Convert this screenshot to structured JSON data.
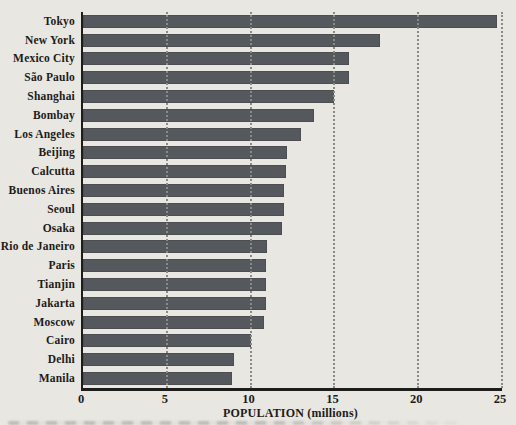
{
  "chart_data": {
    "type": "bar",
    "orientation": "horizontal",
    "title": "",
    "xlabel": "POPULATION (millions)",
    "ylabel": "",
    "categories": [
      "Tokyo",
      "New York",
      "Mexico City",
      "São Paulo",
      "Shanghai",
      "Bombay",
      "Los Angeles",
      "Beijing",
      "Calcutta",
      "Buenos Aires",
      "Seoul",
      "Osaka",
      "Rio de Janeiro",
      "Paris",
      "Tianjin",
      "Jakarta",
      "Moscow",
      "Cairo",
      "Delhi",
      "Manila"
    ],
    "values": [
      24.7,
      17.7,
      15.9,
      15.9,
      15.0,
      13.8,
      13.0,
      12.2,
      12.1,
      12.0,
      12.0,
      11.9,
      11.0,
      10.9,
      10.9,
      10.9,
      10.8,
      10.0,
      9.0,
      8.9
    ],
    "xlim": [
      0,
      25
    ],
    "xticks": [
      0,
      5,
      10,
      15,
      20,
      25
    ],
    "grid": "vertical-dotted",
    "legend": "none",
    "colors": {
      "bar": "#55585c",
      "background": "#e9e7e1",
      "gridline": "#8b8b85",
      "axis": "#1d1d1b",
      "text": "#1c1c1a"
    }
  }
}
